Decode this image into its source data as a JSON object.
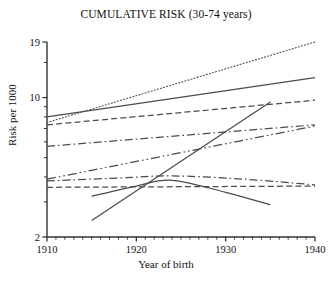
{
  "chart_data": {
    "type": "line",
    "title": "CUMULATIVE RISK (30-74 years)",
    "xlabel": "Year of birth",
    "ylabel": "Risk per 1000",
    "xlim": [
      1910,
      1940
    ],
    "ylim": [
      2,
      19
    ],
    "yscale": "log",
    "grid": false,
    "legend": "none",
    "xticks": [
      1910,
      1920,
      1930,
      1940
    ],
    "xtick_labels": [
      "1910",
      "1920",
      "1930",
      "1940"
    ],
    "xminor_step": 1,
    "yticks": [
      2,
      19
    ],
    "ytick_labels": [
      "2",
      "19"
    ],
    "ytick_label_10": "10",
    "yminor_ticks": [
      3,
      4,
      5,
      6,
      7,
      8,
      9,
      10,
      15
    ],
    "series": [
      {
        "name": "series-1-dotted",
        "style": "dotted",
        "x": [
          1910,
          1940
        ],
        "values": [
          7.5,
          19.0
        ]
      },
      {
        "name": "series-2-solid",
        "style": "solid",
        "x": [
          1910,
          1940
        ],
        "values": [
          8.0,
          12.6
        ]
      },
      {
        "name": "series-3-dashed",
        "style": "dashed",
        "x": [
          1910,
          1940
        ],
        "values": [
          7.3,
          9.7
        ]
      },
      {
        "name": "series-4-dash-dot",
        "style": "dash-dot",
        "x": [
          1910,
          1940
        ],
        "values": [
          5.7,
          7.3
        ]
      },
      {
        "name": "series-5-dash-dot-dot",
        "style": "dash-dot-dot",
        "x": [
          1910,
          1940
        ],
        "values": [
          3.9,
          7.2
        ]
      },
      {
        "name": "series-6-thin-dash-dot",
        "style": "dash-dot",
        "x": [
          1910,
          1918,
          1924,
          1932,
          1940
        ],
        "values": [
          3.82,
          3.95,
          4.05,
          3.9,
          3.65
        ]
      },
      {
        "name": "series-7-flat-dashed",
        "style": "dashed",
        "x": [
          1910,
          1940
        ],
        "values": [
          3.55,
          3.6
        ]
      },
      {
        "name": "series-8-steep-rise-solid",
        "style": "solid",
        "x": [
          1915,
          1935
        ],
        "values": [
          2.42,
          9.5
        ]
      },
      {
        "name": "series-9-peak-decline-solid",
        "style": "solid",
        "x": [
          1915,
          1920,
          1924,
          1930,
          1935
        ],
        "values": [
          3.2,
          3.6,
          3.85,
          3.35,
          2.9
        ]
      }
    ]
  },
  "colors": {
    "axis": "#333333",
    "line": "#4a4a52",
    "text": "#111111",
    "background": "#ffffff"
  }
}
